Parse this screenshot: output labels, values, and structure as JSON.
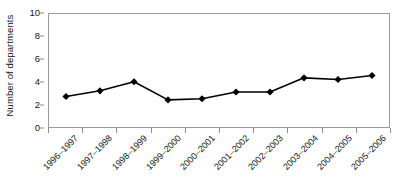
{
  "chart_data": {
    "type": "line",
    "title": "",
    "xlabel": "",
    "ylabel": "Number of departments",
    "ylim": [
      0,
      10
    ],
    "ytick_values": [
      0,
      2,
      4,
      6,
      8,
      10
    ],
    "ytick_labels": [
      "0",
      "2",
      "4",
      "6",
      "8",
      "10"
    ],
    "grid": false,
    "legend": "none",
    "marker": "diamond",
    "marker_color": "#000000",
    "line_color": "#000000",
    "categories": [
      "1996–1997",
      "1997–1998",
      "1998–1999",
      "1999–2000",
      "2000–2001",
      "2001–2002",
      "2002–2003",
      "2003–2004",
      "2004–2005",
      "2005–2006"
    ],
    "values": [
      2.7,
      3.2,
      4.0,
      2.4,
      2.5,
      3.1,
      3.1,
      4.35,
      4.2,
      4.55
    ],
    "series": [
      {
        "name": "Number of departments",
        "values": [
          2.7,
          3.2,
          4.0,
          2.4,
          2.5,
          3.1,
          3.1,
          4.35,
          4.2,
          4.55
        ]
      }
    ]
  }
}
